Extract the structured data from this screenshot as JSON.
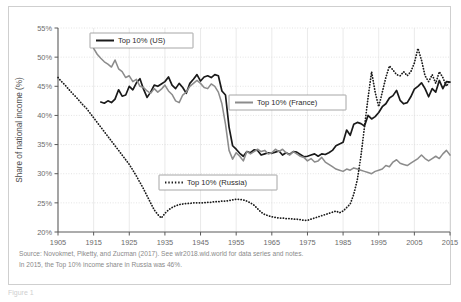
{
  "figure": {
    "below_frame_label": "Figure 1"
  },
  "caption": {
    "line1": "Source: Novokmet, Piketty, and Zucman (2017). See wir2018.wid.world for data series and notes.",
    "line2": "In 2015, the Top 10% income share in Russia was 46%."
  },
  "chart_data": {
    "type": "line",
    "title": "",
    "xlabel": "",
    "ylabel": "Share of national income (%)",
    "xlim": [
      1905,
      2015
    ],
    "ylim": [
      20,
      55
    ],
    "ytick_labels": [
      "20%",
      "25%",
      "30%",
      "35%",
      "40%",
      "45%",
      "50%",
      "55%"
    ],
    "ytick_values": [
      20,
      25,
      30,
      35,
      40,
      45,
      50,
      55
    ],
    "xtick_labels": [
      "1905",
      "1915",
      "1925",
      "1935",
      "1945",
      "1955",
      "1965",
      "1975",
      "1985",
      "1995",
      "2005",
      "2015"
    ],
    "xtick_values": [
      1905,
      1915,
      1925,
      1935,
      1945,
      1955,
      1965,
      1975,
      1985,
      1995,
      2005,
      2015
    ],
    "grid": true,
    "legend_position": "inside-multiple",
    "series": [
      {
        "name": "Top 10% (US)",
        "key": "us",
        "color": "#1a1a1a",
        "style": "solid",
        "x": [
          1917,
          1918,
          1919,
          1920,
          1921,
          1922,
          1923,
          1924,
          1925,
          1926,
          1927,
          1928,
          1929,
          1930,
          1931,
          1932,
          1933,
          1934,
          1935,
          1936,
          1937,
          1938,
          1939,
          1940,
          1941,
          1942,
          1943,
          1944,
          1945,
          1946,
          1947,
          1948,
          1949,
          1950,
          1951,
          1952,
          1953,
          1954,
          1955,
          1956,
          1957,
          1958,
          1959,
          1960,
          1961,
          1962,
          1963,
          1964,
          1965,
          1966,
          1967,
          1968,
          1969,
          1970,
          1971,
          1972,
          1973,
          1974,
          1975,
          1976,
          1977,
          1978,
          1979,
          1980,
          1981,
          1982,
          1983,
          1984,
          1985,
          1986,
          1987,
          1988,
          1989,
          1990,
          1991,
          1992,
          1993,
          1994,
          1995,
          1996,
          1997,
          1998,
          1999,
          2000,
          2001,
          2002,
          2003,
          2004,
          2005,
          2006,
          2007,
          2008,
          2009,
          2010,
          2011,
          2012,
          2013,
          2014,
          2015
        ],
        "y": [
          42.3,
          42.1,
          42.5,
          42.2,
          42.8,
          44.4,
          43.3,
          43.5,
          45.0,
          44.4,
          45.6,
          46.3,
          44.5,
          43.1,
          44.0,
          45.2,
          45.0,
          45.4,
          45.8,
          46.6,
          45.2,
          44.6,
          45.5,
          44.8,
          43.8,
          45.5,
          46.2,
          47.0,
          45.9,
          46.6,
          46.8,
          46.5,
          47.0,
          46.8,
          44.2,
          43.5,
          38.0,
          34.8,
          34.2,
          33.5,
          33.0,
          33.8,
          33.6,
          34.1,
          34.0,
          33.2,
          33.4,
          33.6,
          33.5,
          33.7,
          33.9,
          33.2,
          33.6,
          33.3,
          33.8,
          33.7,
          33.3,
          32.9,
          33.0,
          33.2,
          33.4,
          33.0,
          33.4,
          33.3,
          33.6,
          34.0,
          34.8,
          35.1,
          35.4,
          37.5,
          36.6,
          38.5,
          38.8,
          38.6,
          38.2,
          40.0,
          39.4,
          39.8,
          40.5,
          41.5,
          42.0,
          43.0,
          43.4,
          44.3,
          42.6,
          42.0,
          42.2,
          43.2,
          44.5,
          45.0,
          45.6,
          44.6,
          43.2,
          44.6,
          44.0,
          46.0,
          44.6,
          45.8,
          45.7
        ]
      },
      {
        "name": "Top 10% (France)",
        "key": "france",
        "color": "#8c8c8c",
        "style": "solid",
        "x": [
          1915,
          1916,
          1917,
          1918,
          1919,
          1920,
          1921,
          1922,
          1923,
          1924,
          1925,
          1926,
          1927,
          1928,
          1929,
          1930,
          1931,
          1932,
          1933,
          1934,
          1935,
          1936,
          1937,
          1938,
          1939,
          1940,
          1941,
          1942,
          1943,
          1944,
          1945,
          1946,
          1947,
          1948,
          1949,
          1950,
          1951,
          1952,
          1953,
          1954,
          1955,
          1956,
          1957,
          1958,
          1959,
          1960,
          1961,
          1962,
          1963,
          1964,
          1965,
          1966,
          1967,
          1968,
          1969,
          1970,
          1971,
          1972,
          1973,
          1974,
          1975,
          1976,
          1977,
          1978,
          1979,
          1980,
          1981,
          1982,
          1983,
          1984,
          1985,
          1986,
          1987,
          1988,
          1989,
          1990,
          1991,
          1992,
          1993,
          1994,
          1995,
          1996,
          1997,
          1998,
          1999,
          2000,
          2001,
          2002,
          2003,
          2004,
          2005,
          2006,
          2007,
          2008,
          2009,
          2010,
          2011,
          2012,
          2013,
          2014,
          2015
        ],
        "y": [
          51.5,
          50.5,
          49.8,
          49.2,
          48.8,
          48.3,
          49.5,
          48.0,
          47.5,
          46.5,
          46.8,
          45.8,
          46.2,
          45.0,
          44.8,
          44.2,
          43.8,
          44.6,
          44.0,
          44.5,
          45.2,
          44.2,
          43.6,
          42.5,
          42.2,
          43.5,
          44.0,
          45.0,
          45.5,
          46.0,
          45.5,
          44.8,
          44.6,
          45.4,
          45.0,
          44.0,
          42.0,
          38.5,
          34.0,
          32.5,
          33.6,
          33.0,
          32.2,
          33.8,
          33.4,
          33.8,
          34.2,
          33.8,
          34.0,
          33.4,
          33.6,
          34.2,
          33.8,
          34.2,
          33.6,
          33.2,
          33.8,
          33.4,
          33.0,
          32.8,
          32.2,
          32.6,
          32.0,
          32.2,
          32.8,
          32.0,
          31.6,
          31.2,
          30.8,
          30.6,
          30.4,
          30.8,
          30.6,
          31.0,
          30.8,
          30.6,
          30.4,
          30.2,
          30.0,
          30.4,
          30.6,
          30.8,
          31.4,
          31.2,
          32.0,
          32.4,
          31.8,
          31.6,
          31.4,
          31.8,
          32.2,
          32.6,
          33.2,
          32.6,
          32.2,
          32.6,
          33.0,
          32.6,
          33.4,
          34.0,
          33.2
        ]
      },
      {
        "name": "Top 10% (Russia)",
        "key": "russia",
        "color": "#1a1a1a",
        "style": "dotted",
        "x": [
          1905,
          1906,
          1907,
          1908,
          1909,
          1910,
          1911,
          1912,
          1913,
          1914,
          1915,
          1916,
          1917,
          1918,
          1919,
          1920,
          1921,
          1922,
          1923,
          1924,
          1925,
          1926,
          1927,
          1928,
          1929,
          1930,
          1931,
          1932,
          1933,
          1934,
          1935,
          1936,
          1937,
          1938,
          1939,
          1940,
          1941,
          1942,
          1943,
          1944,
          1945,
          1946,
          1947,
          1948,
          1949,
          1950,
          1951,
          1952,
          1953,
          1954,
          1955,
          1956,
          1957,
          1958,
          1959,
          1960,
          1961,
          1962,
          1963,
          1964,
          1965,
          1966,
          1967,
          1968,
          1969,
          1970,
          1971,
          1972,
          1973,
          1974,
          1975,
          1976,
          1977,
          1978,
          1979,
          1980,
          1981,
          1982,
          1983,
          1984,
          1985,
          1986,
          1987,
          1988,
          1989,
          1990,
          1991,
          1992,
          1993,
          1994,
          1995,
          1996,
          1997,
          1998,
          1999,
          2000,
          2001,
          2002,
          2003,
          2004,
          2005,
          2006,
          2007,
          2008,
          2009,
          2010,
          2011,
          2012,
          2013,
          2014,
          2015
        ],
        "y": [
          46.5,
          45.8,
          45.2,
          44.5,
          43.8,
          43.2,
          42.5,
          41.8,
          41.2,
          40.4,
          39.6,
          38.8,
          38.0,
          37.2,
          36.4,
          35.6,
          34.8,
          34.0,
          33.2,
          32.4,
          31.6,
          30.6,
          29.6,
          28.5,
          27.4,
          26.2,
          25.0,
          23.8,
          23.0,
          22.4,
          23.2,
          23.8,
          24.2,
          24.5,
          24.7,
          24.8,
          24.9,
          24.9,
          25.0,
          25.0,
          25.0,
          25.0,
          25.1,
          25.1,
          25.2,
          25.2,
          25.3,
          25.3,
          25.4,
          25.5,
          25.6,
          25.6,
          25.5,
          25.3,
          25.0,
          24.6,
          24.0,
          23.4,
          23.0,
          22.8,
          22.6,
          22.5,
          22.4,
          22.4,
          22.3,
          22.3,
          22.2,
          22.2,
          22.1,
          22.0,
          22.0,
          22.2,
          22.4,
          22.6,
          22.8,
          23.0,
          23.2,
          23.4,
          23.6,
          23.3,
          23.6,
          24.2,
          24.8,
          26.5,
          29.0,
          33.0,
          38.0,
          43.0,
          47.5,
          44.0,
          41.5,
          44.0,
          46.5,
          48.5,
          47.8,
          47.0,
          46.8,
          47.5,
          46.8,
          47.5,
          49.0,
          51.5,
          49.5,
          46.8,
          45.8,
          47.0,
          45.5,
          47.5,
          46.5,
          45.0,
          46.0
        ]
      }
    ]
  },
  "legends": [
    {
      "label": "Top 10% (US)",
      "style": "solid",
      "color": "#1a1a1a"
    },
    {
      "label": "Top 10% (France)",
      "style": "solid",
      "color": "#8c8c8c"
    },
    {
      "label": "Top 10% (Russia)",
      "style": "dotted",
      "color": "#1a1a1a"
    }
  ]
}
